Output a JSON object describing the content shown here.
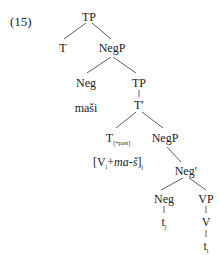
{
  "example_number": "(15)",
  "tree": {
    "root": "TP",
    "t_left": "T",
    "negp1": "NegP",
    "neg1": "Neg",
    "neg1_lex": "maši",
    "tp2": "TP",
    "tbar": "T′",
    "t_past": "T",
    "t_past_sub": "[+past]",
    "moved_open": "[V",
    "moved_idx": "i",
    "moved_plus": "+",
    "moved_morph": "ma-š",
    "moved_close": "]",
    "moved_close_idx": "j",
    "negp2": "NegP",
    "negbar": "Neg′",
    "neg2": "Neg",
    "vp": "VP",
    "trace_j": "t",
    "trace_j_idx": "j",
    "v": "V",
    "trace_i": "t",
    "trace_i_idx": "i"
  }
}
